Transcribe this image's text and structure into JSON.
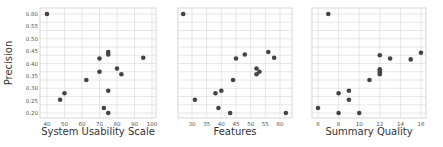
{
  "chart_data": [
    {
      "type": "scatter",
      "title": "",
      "xlabel": "System Usability Scale",
      "ylabel": "Precision",
      "xlim": [
        38,
        102
      ],
      "ylim": [
        0.185,
        0.82
      ],
      "xticks": [
        40,
        50,
        60,
        70,
        80,
        90,
        100
      ],
      "yticks": [
        0.2,
        0.25,
        0.3,
        0.35,
        0.4,
        0.45,
        0.5,
        0.55,
        0.6
      ],
      "ytick_labels": [
        "0.20",
        "0.25",
        "0.30",
        "0.35",
        "0.40",
        "0.45",
        "0.50",
        "0.55",
        "0.60"
      ],
      "grid": true,
      "points": [
        {
          "x": 40,
          "y": 0.8
        },
        {
          "x": 75,
          "y": 0.57
        },
        {
          "x": 75,
          "y": 0.555
        },
        {
          "x": 95,
          "y": 0.535
        },
        {
          "x": 70,
          "y": 0.53
        },
        {
          "x": 80,
          "y": 0.47
        },
        {
          "x": 70,
          "y": 0.45
        },
        {
          "x": 82.5,
          "y": 0.435
        },
        {
          "x": 62.5,
          "y": 0.4
        },
        {
          "x": 75,
          "y": 0.335
        },
        {
          "x": 50,
          "y": 0.32
        },
        {
          "x": 47.5,
          "y": 0.28
        },
        {
          "x": 72.5,
          "y": 0.23
        },
        {
          "x": 75,
          "y": 0.2
        }
      ]
    },
    {
      "type": "scatter",
      "title": "",
      "xlabel": "Features",
      "ylabel": "",
      "xlim": [
        25,
        64
      ],
      "ylim": [
        0.185,
        0.82
      ],
      "xticks": [
        30,
        35,
        40,
        45,
        50,
        55,
        60
      ],
      "grid": true,
      "points": [
        {
          "x": 27,
          "y": 0.8
        },
        {
          "x": 56,
          "y": 0.57
        },
        {
          "x": 48,
          "y": 0.555
        },
        {
          "x": 58,
          "y": 0.535
        },
        {
          "x": 45,
          "y": 0.53
        },
        {
          "x": 52,
          "y": 0.47
        },
        {
          "x": 53,
          "y": 0.45
        },
        {
          "x": 52,
          "y": 0.435
        },
        {
          "x": 44,
          "y": 0.4
        },
        {
          "x": 40,
          "y": 0.335
        },
        {
          "x": 38,
          "y": 0.32
        },
        {
          "x": 31,
          "y": 0.28
        },
        {
          "x": 39,
          "y": 0.23
        },
        {
          "x": 43,
          "y": 0.2
        },
        {
          "x": 62,
          "y": 0.2
        }
      ]
    },
    {
      "type": "scatter",
      "title": "",
      "xlabel": "Summary Quality",
      "ylabel": "",
      "xlim": [
        5.6,
        16.5
      ],
      "ylim": [
        0.185,
        0.82
      ],
      "xticks": [
        6,
        8,
        10,
        12,
        14,
        16
      ],
      "grid": true,
      "points": [
        {
          "x": 7,
          "y": 0.8
        },
        {
          "x": 16,
          "y": 0.565
        },
        {
          "x": 12,
          "y": 0.55
        },
        {
          "x": 13,
          "y": 0.53
        },
        {
          "x": 15,
          "y": 0.525
        },
        {
          "x": 12,
          "y": 0.465
        },
        {
          "x": 12,
          "y": 0.455
        },
        {
          "x": 12,
          "y": 0.445
        },
        {
          "x": 12,
          "y": 0.435
        },
        {
          "x": 11,
          "y": 0.4
        },
        {
          "x": 9,
          "y": 0.335
        },
        {
          "x": 8,
          "y": 0.32
        },
        {
          "x": 9,
          "y": 0.28
        },
        {
          "x": 6,
          "y": 0.23
        },
        {
          "x": 8,
          "y": 0.2
        },
        {
          "x": 10,
          "y": 0.2
        }
      ]
    }
  ],
  "style": {
    "point_color": "#444444",
    "grid_color": "#dddddd",
    "frame_color": "#cccccc"
  },
  "layout": {
    "panels": [
      {
        "left": 40,
        "right": 156,
        "top": 8,
        "bottom": 118
      },
      {
        "left": 178,
        "right": 292,
        "top": 8,
        "bottom": 118
      },
      {
        "left": 312,
        "right": 426,
        "top": 8,
        "bottom": 118
      }
    ],
    "y_px": {
      "v0": 0.8,
      "p0": 14,
      "v1": 0.2,
      "p1": 113
    }
  }
}
